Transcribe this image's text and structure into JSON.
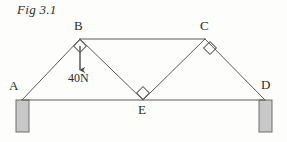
{
  "figure": {
    "caption": "Fig 3.1",
    "type": "statics-truss-diagram",
    "background_color": "#fdfdfc",
    "line_color": "#5a5a5a",
    "text_color": "#2b2b2b",
    "support_fill_color": "#c8c8c8",
    "support_stroke_color": "#6e6e6e"
  },
  "nodes": [
    {
      "id": "A",
      "label": "A",
      "x": 22,
      "y": 100,
      "label_x": 9,
      "label_y": 78
    },
    {
      "id": "B",
      "label": "B",
      "x": 80,
      "y": 39,
      "label_x": 74,
      "label_y": 18
    },
    {
      "id": "C",
      "label": "C",
      "x": 205,
      "y": 39,
      "label_x": 200,
      "label_y": 18
    },
    {
      "id": "D",
      "label": "D",
      "x": 265,
      "y": 100,
      "label_x": 261,
      "label_y": 77
    },
    {
      "id": "E",
      "label": "E",
      "x": 143,
      "y": 100,
      "label_x": 138,
      "label_y": 102
    }
  ],
  "members": [
    {
      "name": "member-A-B",
      "from": "A",
      "to": "B"
    },
    {
      "name": "member-B-C",
      "from": "B",
      "to": "C"
    },
    {
      "name": "member-C-D",
      "from": "C",
      "to": "D"
    },
    {
      "name": "member-A-D",
      "from": "A",
      "to": "D"
    },
    {
      "name": "member-B-E",
      "from": "B",
      "to": "E"
    },
    {
      "name": "member-C-E",
      "from": "C",
      "to": "E"
    }
  ],
  "right_angle_markers": [
    {
      "name": "right-angle-marker-B",
      "cx": 80,
      "cy": 46,
      "size": 6
    },
    {
      "name": "right-angle-marker-C",
      "cx": 210,
      "cy": 48,
      "size": 6
    },
    {
      "name": "right-angle-marker-E",
      "cx": 143,
      "cy": 93,
      "size": 6
    }
  ],
  "load": {
    "label": "40N",
    "label_x": 68,
    "label_y": 71,
    "arrow_x": 80,
    "arrow_y_start": 46,
    "arrow_y_end": 70
  },
  "supports": [
    {
      "name": "support-left",
      "x": 16,
      "y": 100,
      "width": 13,
      "height": 32
    },
    {
      "name": "support-right",
      "x": 259,
      "y": 100,
      "width": 13,
      "height": 32
    }
  ]
}
